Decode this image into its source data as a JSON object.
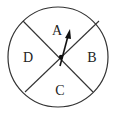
{
  "diagram": {
    "type": "spinner",
    "sections": [
      {
        "id": "A",
        "label": "A",
        "position": "top"
      },
      {
        "id": "B",
        "label": "B",
        "position": "right"
      },
      {
        "id": "C",
        "label": "C",
        "position": "bottom"
      },
      {
        "id": "D",
        "label": "D",
        "position": "left"
      }
    ],
    "arrow": {
      "points_to": "A"
    },
    "colors": {
      "stroke": "#222222",
      "background": "#ffffff"
    }
  }
}
